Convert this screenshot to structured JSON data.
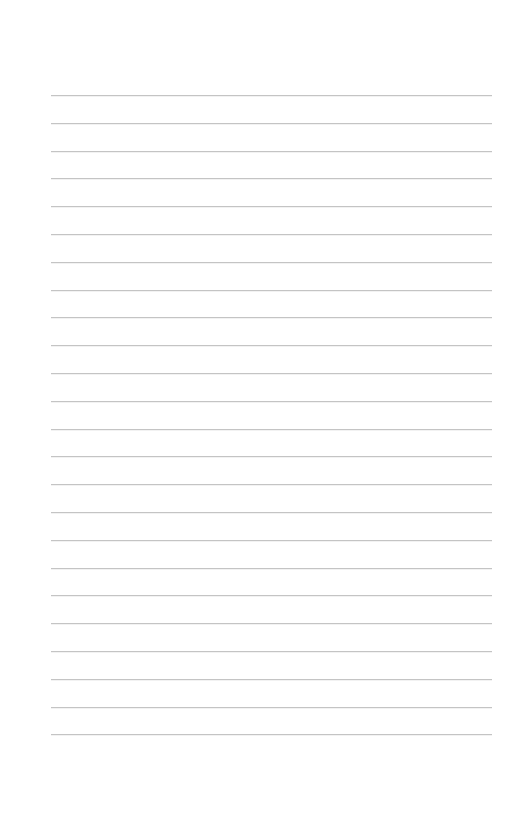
{
  "page": {
    "type": "lined-paper",
    "background_color": "#ffffff",
    "line_color": "#c4c4c4",
    "line_count": 24,
    "first_line_y": 95,
    "line_spacing": 27.8,
    "line_left_x": 51,
    "line_right_x": 492
  }
}
